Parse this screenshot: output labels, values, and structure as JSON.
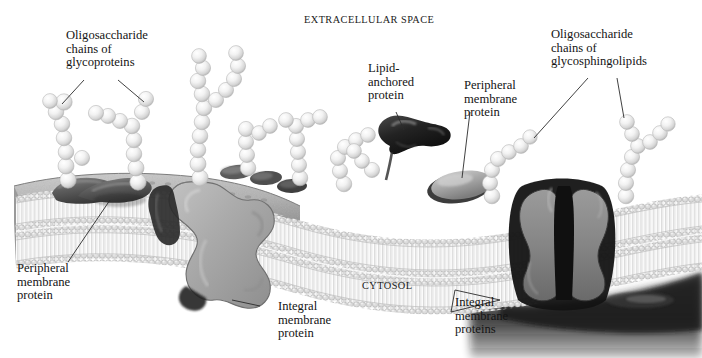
{
  "figure": {
    "kind": "biological-illustration",
    "style": "grayscale airbrush textbook art",
    "width": 702,
    "height": 358,
    "background": "#ffffff"
  },
  "compartments": {
    "extracellular": "EXTRACELLULAR SPACE",
    "cytosol": "CYTOSOL"
  },
  "labels": {
    "glycoproteins": "Oligosaccharide\nchains of\nglycoproteins",
    "lipid_anchored": "Lipid-\nanchored\nprotein",
    "peripheral_top": "Peripheral\nmembrane\nprotein",
    "glycosphingolipids": "Oligosaccharide\nchains of\nglycosphingolipids",
    "peripheral_left": "Peripheral\nmembrane\nprotein",
    "integral_single": "Integral\nmembrane\nprotein",
    "integral_plural": "Integral\nmembrane\nproteins"
  },
  "cropped_header_text": "",
  "colors": {
    "ink": "#141414",
    "leader_line": "#2b2b2b",
    "membrane_head": "#d9d9d9",
    "membrane_tail": "#fbfbfb",
    "integral_protein": "#a9a9a9",
    "channel_protein": "#8f8f8f",
    "channel_pore": "#141414",
    "peripheral_protein": "#6d6d6d",
    "lipid_anchor_protein": "#2a2a2a",
    "sugar_bead": "#ededed",
    "cytosol_shade": "#1d1d1d",
    "surface_texture": "#b4b4b4",
    "background": "#ffffff"
  },
  "structures": {
    "glycoprotein_chains_count": 8,
    "glycosphingolipid_chains_count": 2,
    "peripheral_proteins_count": 3,
    "lipid_anchored_proteins_count": 1,
    "integral_proteins_count": 3,
    "bilayer_leaflets": 2
  }
}
